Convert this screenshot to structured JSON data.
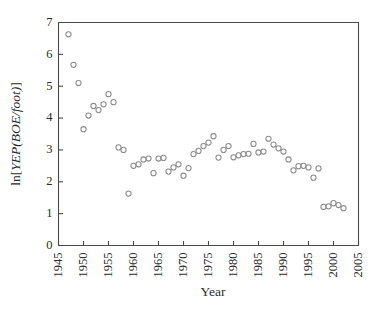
{
  "chart_data": {
    "type": "scatter",
    "title": "",
    "xlabel": "Year",
    "ylabel": "ln[YEP(BOE/foot)]",
    "ylabel_parts": {
      "prefix": "ln[",
      "italic": "YEP(BOE/foot)",
      "suffix": "]"
    },
    "xlim": [
      1945,
      2005
    ],
    "ylim": [
      0,
      7
    ],
    "xticks": [
      1945,
      1950,
      1955,
      1960,
      1965,
      1970,
      1975,
      1980,
      1985,
      1990,
      1995,
      2000,
      2005
    ],
    "yticks": [
      0,
      1,
      2,
      3,
      4,
      5,
      6,
      7
    ],
    "xtick_labels": [
      "1945",
      "1950",
      "1955",
      "1960",
      "1965",
      "1970",
      "1975",
      "1980",
      "1985",
      "1990",
      "1995",
      "2000",
      "2005"
    ],
    "ytick_labels": [
      "0",
      "1",
      "2",
      "3",
      "4",
      "5",
      "6",
      "7"
    ],
    "xtick_rotation": -90,
    "grid": false,
    "legend": null,
    "marker": {
      "shape": "circle",
      "filled": false,
      "radius": 2.6,
      "stroke_color": "#8b8b8b",
      "stroke_width": 1.05
    },
    "axis_color": "#4a4a4a",
    "background_color": "#ffffff",
    "series": [
      {
        "name": "YEP",
        "x": [
          1947,
          1948,
          1949,
          1950,
          1951,
          1952,
          1953,
          1954,
          1955,
          1956,
          1957,
          1958,
          1959,
          1960,
          1961,
          1962,
          1963,
          1964,
          1965,
          1966,
          1967,
          1968,
          1969,
          1970,
          1971,
          1972,
          1973,
          1974,
          1975,
          1976,
          1977,
          1978,
          1979,
          1980,
          1981,
          1982,
          1983,
          1984,
          1985,
          1986,
          1987,
          1988,
          1989,
          1990,
          1991,
          1992,
          1993,
          1994,
          1995,
          1996,
          1997,
          1998,
          1999,
          2000,
          2001,
          2002
        ],
        "y": [
          6.63,
          5.67,
          5.1,
          3.65,
          4.08,
          4.38,
          4.25,
          4.43,
          4.75,
          4.5,
          3.08,
          3.0,
          1.63,
          2.5,
          2.55,
          2.7,
          2.73,
          2.27,
          2.73,
          2.75,
          2.32,
          2.45,
          2.55,
          2.19,
          2.43,
          2.87,
          2.97,
          3.12,
          3.23,
          3.43,
          2.76,
          3.0,
          3.12,
          2.77,
          2.83,
          2.87,
          2.88,
          3.19,
          2.92,
          2.95,
          3.35,
          3.17,
          3.05,
          2.95,
          2.7,
          2.36,
          2.49,
          2.5,
          2.45,
          2.13,
          2.42,
          1.21,
          1.23,
          1.33,
          1.27,
          1.17
        ]
      }
    ]
  }
}
